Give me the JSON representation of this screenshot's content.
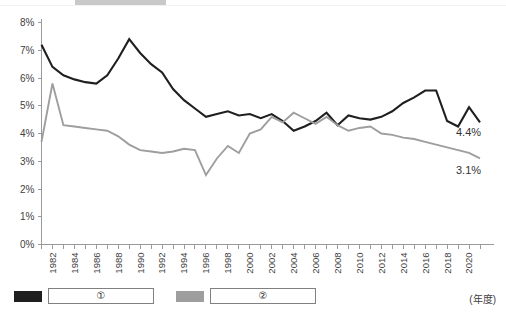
{
  "chart_data": {
    "type": "line",
    "title": "",
    "subtitle": "",
    "xlabel": "(年度)",
    "ylabel": "",
    "ylim": [
      0,
      8
    ],
    "ytick_labels": [
      "0%",
      "1%",
      "2%",
      "3%",
      "4%",
      "5%",
      "6%",
      "7%",
      "8%"
    ],
    "ytick_values": [
      0,
      1,
      2,
      3,
      4,
      5,
      6,
      7,
      8
    ],
    "grid": false,
    "legend_position": "bottom-left",
    "x": [
      1981,
      1982,
      1983,
      1984,
      1985,
      1986,
      1987,
      1988,
      1989,
      1990,
      1991,
      1992,
      1993,
      1994,
      1995,
      1996,
      1997,
      1998,
      1999,
      2000,
      2001,
      2002,
      2003,
      2004,
      2005,
      2006,
      2007,
      2008,
      2009,
      2010,
      2011,
      2012,
      2013,
      2014,
      2015,
      2016,
      2017,
      2018,
      2019,
      2020,
      2021
    ],
    "xtick_labels": [
      "1982",
      "1984",
      "1986",
      "1988",
      "1990",
      "1992",
      "1994",
      "1996",
      "1998",
      "2000",
      "2002",
      "2004",
      "2006",
      "2008",
      "2010",
      "2012",
      "2014",
      "2016",
      "2018",
      "2020"
    ],
    "series": [
      {
        "name": "①",
        "color": "#1f1f1f",
        "values": [
          7.2,
          6.4,
          6.1,
          5.95,
          5.85,
          5.8,
          6.1,
          6.7,
          7.4,
          6.9,
          6.5,
          6.2,
          5.6,
          5.2,
          4.9,
          4.6,
          4.7,
          4.8,
          4.65,
          4.7,
          4.55,
          4.7,
          4.45,
          4.1,
          4.25,
          4.45,
          4.75,
          4.3,
          4.65,
          4.55,
          4.5,
          4.6,
          4.8,
          5.1,
          5.3,
          5.55,
          5.55,
          4.45,
          4.25,
          4.95,
          4.4
        ]
      },
      {
        "name": "②",
        "color": "#9e9e9e",
        "values": [
          3.7,
          5.8,
          4.3,
          4.25,
          4.2,
          4.15,
          4.1,
          3.9,
          3.6,
          3.4,
          3.35,
          3.3,
          3.35,
          3.45,
          3.4,
          2.5,
          3.1,
          3.55,
          3.3,
          4.0,
          4.15,
          4.6,
          4.4,
          4.75,
          4.55,
          4.35,
          4.6,
          4.3,
          4.1,
          4.2,
          4.25,
          4.0,
          3.95,
          3.85,
          3.8,
          3.7,
          3.6,
          3.5,
          3.4,
          3.3,
          3.1
        ]
      }
    ],
    "annotations": [
      {
        "text": "4.4%",
        "series": "①",
        "x": 2021,
        "y": 4.4
      },
      {
        "text": "3.1%",
        "series": "②",
        "x": 2021,
        "y": 3.1
      }
    ]
  },
  "legend": {
    "entries": [
      {
        "label": "①",
        "swatch_color": "#1f1f1f"
      },
      {
        "label": "②",
        "swatch_color": "#9e9e9e"
      }
    ]
  },
  "axis": {
    "x_axis_title": "(年度)"
  }
}
